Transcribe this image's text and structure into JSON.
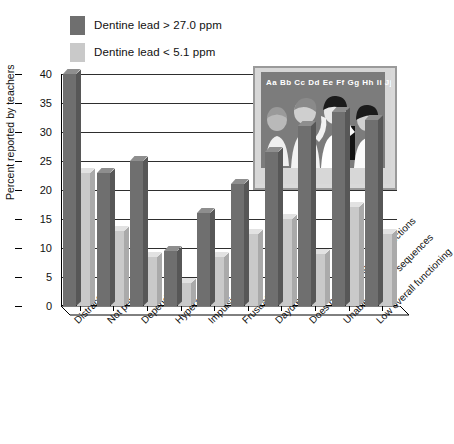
{
  "chart_data": {
    "type": "bar",
    "title": "",
    "xlabel": "",
    "ylabel": "Percent reported by teachers",
    "ylim": [
      0,
      40
    ],
    "yticks": [
      0,
      5,
      10,
      15,
      20,
      25,
      30,
      35,
      40
    ],
    "grid": true,
    "legend_position": "top-left",
    "categories": [
      "Distractable",
      "Not persistent",
      "Dependent",
      "Hyperactive",
      "Impulsive",
      "Frustrated",
      "Daydreamer",
      "Does not follow simple directions",
      "Unable to follow sequences",
      "Low overall functioning"
    ],
    "series": [
      {
        "name": "Dentine lead > 27.0 ppm",
        "color": "#6f6f6f",
        "values": [
          40,
          23,
          25,
          9.5,
          16,
          21,
          26.5,
          31,
          33.5,
          32
        ]
      },
      {
        "name": "Dentine lead < 5.1 ppm",
        "color": "#c9c9c9",
        "values": [
          23,
          13,
          8.5,
          4,
          8.5,
          12.5,
          15,
          9,
          17,
          12.5
        ]
      }
    ]
  },
  "legend": {
    "items": [
      {
        "label": "Dentine lead > 27.0 ppm",
        "color": "#6f6f6f"
      },
      {
        "label": "Dentine lead < 5.1 ppm",
        "color": "#c9c9c9"
      }
    ]
  },
  "inset": {
    "name": "classroom-illustration",
    "blackboard_text": "Aa Bb Cc Dd Ee Ff Gg Hh Ii Jj"
  }
}
